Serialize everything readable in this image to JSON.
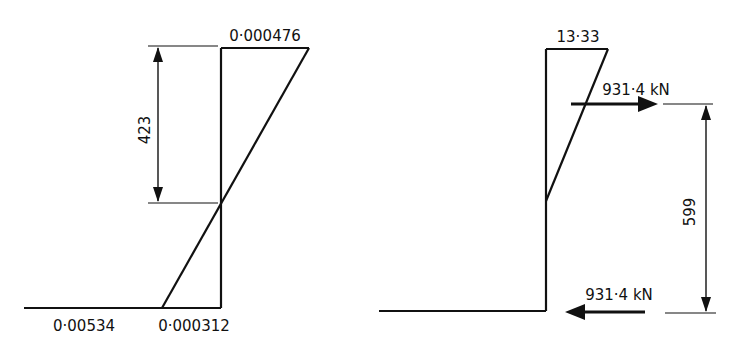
{
  "diagrams": {
    "strain": {
      "title": "strain-distribution",
      "top_strain": "0·000476",
      "bottom_strain_left": "0·00534",
      "bottom_strain_right": "0·000312",
      "neutral_axis_depth": "423"
    },
    "stress": {
      "title": "stress-distribution-and-forces",
      "top_stress": "13·33",
      "compression_force": "931·4 kN",
      "tension_force": "931·4 kN",
      "lever_arm": "599"
    }
  },
  "colors": {
    "line": "#111111",
    "background": "#ffffff"
  }
}
